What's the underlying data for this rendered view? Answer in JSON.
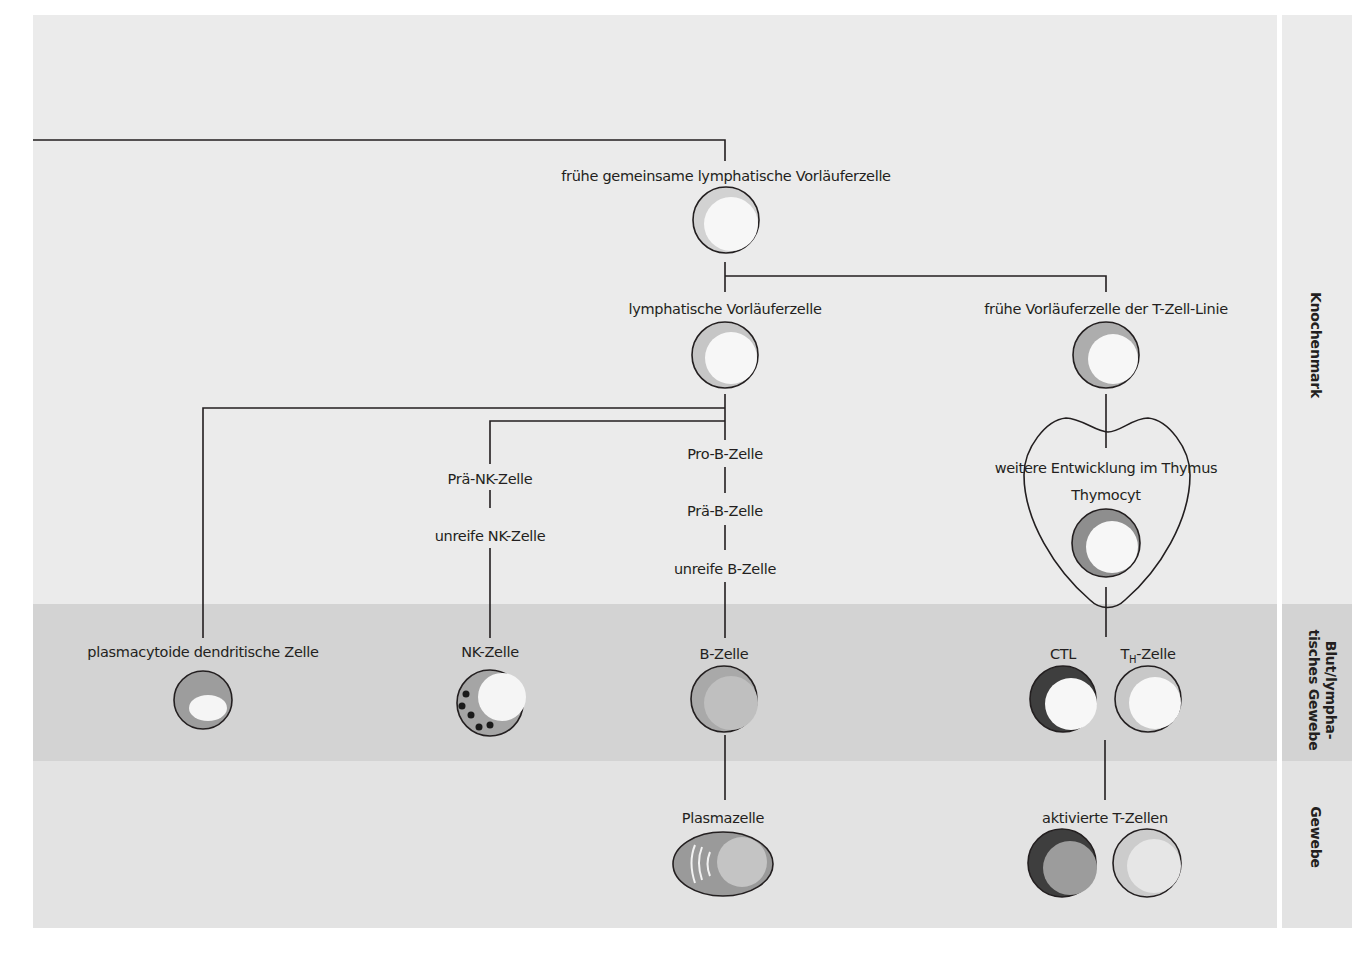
{
  "colors": {
    "band_knochenmark": "#ebebeb",
    "band_blut": "#d3d3d3",
    "band_gewebe": "#e3e3e3",
    "line": "#231f20",
    "cytoplasm_light": "#c9c9c9",
    "cytoplasm_mid": "#a8a8a8",
    "cytoplasm_dark": "#4a4a4a",
    "nucleus": "#f7f7f7"
  },
  "regions": {
    "knochenmark": "Knochenmark",
    "blut_line1": "Blut/lympha-",
    "blut_line2": "tisches Gewebe",
    "gewebe": "Gewebe"
  },
  "nodes": {
    "clp": "frühe gemeinsame lymphatische Vorläuferzelle",
    "lymph_prog": "lymphatische Vorläuferzelle",
    "early_t": "frühe Vorläuferzelle der T-Zell-Linie",
    "thymus": "weitere Entwicklung im Thymus",
    "thymocyte": "Thymocyt",
    "pro_b": "Pro-B-Zelle",
    "pre_b": "Prä-B-Zelle",
    "immature_b": "unreife B-Zelle",
    "pre_nk": "Prä-NK-Zelle",
    "immature_nk": "unreife NK-Zelle",
    "pdc": "plasmacytoide dendritische Zelle",
    "nk": "NK-Zelle",
    "b_cell": "B-Zelle",
    "plasma": "Plasmazelle",
    "ctl": "CTL",
    "th_main": "T",
    "th_sub": "H",
    "th_rest": "-Zelle",
    "activated_t": "aktivierte T-Zellen"
  }
}
